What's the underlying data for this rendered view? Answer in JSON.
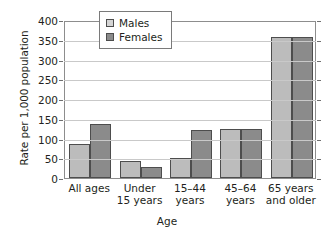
{
  "chart_data": {
    "type": "bar",
    "title": "",
    "xlabel": "Age",
    "ylabel": "Rate per 1,000 population",
    "categories": [
      "All ages",
      "Under 15 years",
      "15–44 years",
      "45–64 years",
      "65 years and older"
    ],
    "category_lines": [
      [
        "All ages",
        ""
      ],
      [
        "Under",
        "15 years"
      ],
      [
        "15–44",
        "years"
      ],
      [
        "45–64",
        "years"
      ],
      [
        "65 years",
        "and older"
      ]
    ],
    "series": [
      {
        "name": "Males",
        "color": "#bcbcbc",
        "values": [
          87,
          42,
          50,
          123,
          357
        ]
      },
      {
        "name": "Females",
        "color": "#8b8b8b",
        "values": [
          137,
          29,
          121,
          123,
          357
        ]
      }
    ],
    "ylim": [
      0,
      400
    ],
    "yticks": [
      400,
      350,
      300,
      250,
      200,
      150,
      100,
      50,
      0
    ],
    "ytick_labels": [
      "400",
      "350",
      "300",
      "250",
      "200",
      "150",
      "100",
      "50",
      "0"
    ],
    "grid": true,
    "legend_position": "upper-center-left",
    "legend_entries": [
      "Males",
      "Females"
    ]
  },
  "legend": {
    "males_label": "Males",
    "females_label": "Females"
  },
  "axes": {
    "y_title": "Rate per 1,000 population",
    "x_title": "Age"
  }
}
